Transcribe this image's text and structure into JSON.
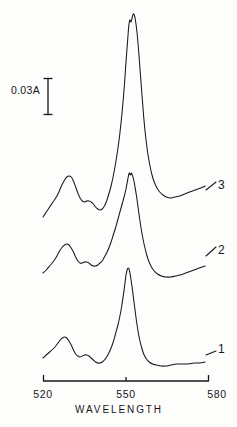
{
  "figure": {
    "type": "absorption-spectrum",
    "background_color": "#fdfdfc",
    "line_color": "#17171a"
  },
  "scale_bar": {
    "label": "0.03A",
    "value": 0.03,
    "unit": "A",
    "x_px": 48,
    "y_top_px": 78,
    "y_bottom_px": 115
  },
  "axis": {
    "title": "WAVELENGTH",
    "tick_labels": [
      "520",
      "550",
      "580"
    ],
    "tick_values": [
      520,
      550,
      580
    ],
    "range": [
      520,
      580
    ],
    "line_y_px": 381,
    "x_start_px": 43,
    "x_end_px": 209
  },
  "curve_labels": {
    "top": "3",
    "middle": "2",
    "bottom": "1"
  },
  "chart_data": {
    "type": "line",
    "title": "",
    "subtitle": "",
    "xlabel": "WAVELENGTH",
    "ylabel": "",
    "xlim": [
      520,
      580
    ],
    "xticks": [
      520,
      550,
      580
    ],
    "xtick_labels": [
      "520",
      "550",
      "580"
    ],
    "grid": false,
    "legend": "inline-right-end-of-trace",
    "yaxis": "absorbance, offset traces, scale bar 0.03 A",
    "annotations": [
      {
        "text": "0.03A",
        "type": "scale-bar",
        "value": 0.03
      }
    ],
    "series": [
      {
        "name": "3",
        "label_position": "right",
        "alpha_peak_nm": 551,
        "beta_peak_nm": 528,
        "points": [
          [
            520.0,
            217
          ],
          [
            521.2,
            212
          ],
          [
            522.4,
            207
          ],
          [
            523.6,
            202
          ],
          [
            524.6,
            198
          ],
          [
            525.4,
            194
          ],
          [
            526.2,
            189
          ],
          [
            527.0,
            184
          ],
          [
            527.8,
            180
          ],
          [
            528.6,
            177
          ],
          [
            529.4,
            176
          ],
          [
            530.2,
            177
          ],
          [
            531.0,
            181
          ],
          [
            531.8,
            187
          ],
          [
            532.6,
            193
          ],
          [
            533.4,
            198
          ],
          [
            534.2,
            201
          ],
          [
            535.0,
            202
          ],
          [
            535.8,
            201
          ],
          [
            536.6,
            201
          ],
          [
            537.4,
            202
          ],
          [
            538.2,
            204
          ],
          [
            539.0,
            207
          ],
          [
            539.8,
            209
          ],
          [
            540.6,
            210
          ],
          [
            541.4,
            209
          ],
          [
            542.2,
            206
          ],
          [
            543.0,
            201
          ],
          [
            543.8,
            194
          ],
          [
            544.6,
            186
          ],
          [
            545.4,
            176
          ],
          [
            546.2,
            164
          ],
          [
            547.0,
            150
          ],
          [
            547.8,
            133
          ],
          [
            548.6,
            112
          ],
          [
            549.4,
            86
          ],
          [
            550.0,
            62
          ],
          [
            550.6,
            40
          ],
          [
            551.0,
            26
          ],
          [
            551.4,
            20
          ],
          [
            551.8,
            22
          ],
          [
            552.2,
            18
          ],
          [
            552.6,
            14
          ],
          [
            553.0,
            15
          ],
          [
            553.4,
            20
          ],
          [
            554.0,
            33
          ],
          [
            554.6,
            52
          ],
          [
            555.2,
            74
          ],
          [
            555.8,
            96
          ],
          [
            556.4,
            117
          ],
          [
            557.0,
            134
          ],
          [
            557.8,
            152
          ],
          [
            558.6,
            165
          ],
          [
            559.4,
            175
          ],
          [
            560.2,
            182
          ],
          [
            561.2,
            188
          ],
          [
            562.2,
            192
          ],
          [
            563.4,
            195
          ],
          [
            564.6,
            197
          ],
          [
            566.0,
            198
          ],
          [
            567.6,
            197
          ],
          [
            569.4,
            196
          ],
          [
            571.2,
            194
          ],
          [
            573.0,
            192
          ],
          [
            575.0,
            190
          ],
          [
            577.0,
            188
          ],
          [
            578.6,
            186
          ]
        ]
      },
      {
        "name": "2",
        "label_position": "right",
        "alpha_peak_nm": 551,
        "beta_peak_nm": 528,
        "points": [
          [
            520.0,
            273
          ],
          [
            521.2,
            270
          ],
          [
            522.4,
            266
          ],
          [
            523.6,
            262
          ],
          [
            524.6,
            258
          ],
          [
            525.4,
            254
          ],
          [
            526.2,
            250
          ],
          [
            527.0,
            247
          ],
          [
            527.8,
            245
          ],
          [
            528.6,
            244
          ],
          [
            529.4,
            245
          ],
          [
            530.2,
            248
          ],
          [
            531.0,
            252
          ],
          [
            531.8,
            257
          ],
          [
            532.6,
            261
          ],
          [
            533.4,
            263
          ],
          [
            534.2,
            263
          ],
          [
            535.0,
            262
          ],
          [
            535.8,
            262
          ],
          [
            536.6,
            263
          ],
          [
            537.4,
            265
          ],
          [
            538.2,
            266
          ],
          [
            539.0,
            266
          ],
          [
            539.8,
            265
          ],
          [
            540.6,
            263
          ],
          [
            541.4,
            261
          ],
          [
            542.2,
            257
          ],
          [
            543.0,
            253
          ],
          [
            543.8,
            248
          ],
          [
            544.6,
            242
          ],
          [
            545.4,
            235
          ],
          [
            546.2,
            228
          ],
          [
            547.0,
            220
          ],
          [
            547.8,
            212
          ],
          [
            548.6,
            204
          ],
          [
            549.4,
            196
          ],
          [
            550.0,
            189
          ],
          [
            550.4,
            183
          ],
          [
            550.8,
            177
          ],
          [
            551.2,
            173
          ],
          [
            551.6,
            175
          ],
          [
            552.0,
            173
          ],
          [
            552.4,
            176
          ],
          [
            552.8,
            180
          ],
          [
            553.2,
            186
          ],
          [
            553.8,
            196
          ],
          [
            554.4,
            208
          ],
          [
            555.0,
            220
          ],
          [
            555.8,
            234
          ],
          [
            556.6,
            245
          ],
          [
            557.4,
            254
          ],
          [
            558.2,
            261
          ],
          [
            559.2,
            267
          ],
          [
            560.2,
            271
          ],
          [
            561.4,
            274
          ],
          [
            562.8,
            276
          ],
          [
            564.4,
            277
          ],
          [
            566.0,
            277
          ],
          [
            567.8,
            276
          ],
          [
            569.6,
            275
          ],
          [
            571.6,
            273
          ],
          [
            573.6,
            271
          ],
          [
            575.6,
            269
          ],
          [
            577.4,
            267
          ],
          [
            578.6,
            266
          ]
        ]
      },
      {
        "name": "1",
        "label_position": "right",
        "alpha_peak_nm": 550,
        "beta_peak_nm": 527,
        "points": [
          [
            520.0,
            358
          ],
          [
            521.2,
            355
          ],
          [
            522.4,
            352
          ],
          [
            523.6,
            349
          ],
          [
            524.6,
            346
          ],
          [
            525.4,
            343
          ],
          [
            526.2,
            340
          ],
          [
            527.0,
            338
          ],
          [
            527.8,
            337
          ],
          [
            528.6,
            338
          ],
          [
            529.4,
            341
          ],
          [
            530.2,
            345
          ],
          [
            531.0,
            350
          ],
          [
            531.8,
            354
          ],
          [
            532.6,
            356
          ],
          [
            533.4,
            357
          ],
          [
            534.2,
            356
          ],
          [
            535.0,
            355
          ],
          [
            535.8,
            355
          ],
          [
            536.6,
            356
          ],
          [
            537.4,
            358
          ],
          [
            538.2,
            360
          ],
          [
            539.0,
            362
          ],
          [
            539.8,
            363
          ],
          [
            540.6,
            363
          ],
          [
            541.4,
            362
          ],
          [
            542.2,
            360
          ],
          [
            543.0,
            357
          ],
          [
            543.8,
            353
          ],
          [
            544.6,
            348
          ],
          [
            545.4,
            342
          ],
          [
            546.2,
            334
          ],
          [
            547.0,
            326
          ],
          [
            547.8,
            316
          ],
          [
            548.4,
            307
          ],
          [
            549.0,
            296
          ],
          [
            549.6,
            284
          ],
          [
            550.0,
            275
          ],
          [
            550.4,
            270
          ],
          [
            550.8,
            268
          ],
          [
            551.2,
            270
          ],
          [
            551.6,
            276
          ],
          [
            552.2,
            287
          ],
          [
            552.8,
            300
          ],
          [
            553.4,
            313
          ],
          [
            554.0,
            325
          ],
          [
            554.8,
            338
          ],
          [
            555.6,
            347
          ],
          [
            556.4,
            354
          ],
          [
            557.4,
            359
          ],
          [
            558.4,
            362
          ],
          [
            559.6,
            364
          ],
          [
            561.0,
            365
          ],
          [
            562.6,
            366
          ],
          [
            564.4,
            366
          ],
          [
            566.2,
            365
          ],
          [
            568.2,
            364
          ],
          [
            570.2,
            364
          ],
          [
            572.4,
            364
          ],
          [
            574.6,
            363
          ],
          [
            576.6,
            363
          ],
          [
            578.6,
            362
          ]
        ]
      }
    ]
  }
}
